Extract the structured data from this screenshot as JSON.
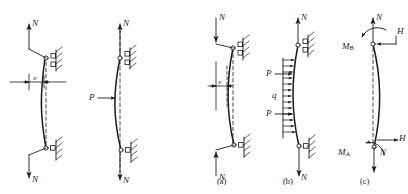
{
  "figure": {
    "type": "engineering-diagram",
    "background_color": "#ffffff",
    "ink_color": "#1a1a1a",
    "panels": [
      {
        "id": "left-1",
        "caption": "",
        "labels": [
          {
            "name": "axial-load-top",
            "text": "N"
          },
          {
            "name": "axial-load-bottom",
            "text": "N"
          },
          {
            "name": "eccentricity",
            "text": "e"
          }
        ]
      },
      {
        "id": "left-2",
        "caption": "",
        "labels": [
          {
            "name": "axial-load-top",
            "text": "N"
          },
          {
            "name": "axial-load-bottom",
            "text": "N"
          },
          {
            "name": "lateral-load",
            "text": "P"
          }
        ]
      },
      {
        "id": "a",
        "caption": "(a)",
        "caption_letter": "a",
        "labels": [
          {
            "name": "axial-load-top",
            "text": "N"
          },
          {
            "name": "axial-load-bottom",
            "text": "N"
          },
          {
            "name": "eccentricity",
            "text": "e"
          }
        ]
      },
      {
        "id": "b",
        "caption": "(b)",
        "caption_letter": "b",
        "labels": [
          {
            "name": "axial-load-top",
            "text": "N"
          },
          {
            "name": "axial-load-bottom",
            "text": "N"
          },
          {
            "name": "lateral-load-upper",
            "text": "P"
          },
          {
            "name": "lateral-load-lower",
            "text": "P"
          },
          {
            "name": "distributed-load",
            "text": "q"
          }
        ]
      },
      {
        "id": "c",
        "caption": "(c)",
        "caption_letter": "c",
        "labels": [
          {
            "name": "axial-load-top",
            "text": "N"
          },
          {
            "name": "axial-load-bottom",
            "text": "N"
          },
          {
            "name": "horizontal-reaction-top",
            "text": "H"
          },
          {
            "name": "horizontal-reaction-bottom",
            "text": "H"
          },
          {
            "name": "moment-top",
            "text": "M",
            "sub": "B"
          },
          {
            "name": "moment-bottom",
            "text": "M",
            "sub": "A"
          }
        ]
      }
    ],
    "text": {
      "N": "N",
      "P": "P",
      "q": "q",
      "H": "H",
      "M": "M",
      "e": "e",
      "sub_A": "A",
      "sub_B": "B",
      "cap_a": "(a)",
      "cap_b": "(b)",
      "cap_c": "(c)"
    }
  }
}
